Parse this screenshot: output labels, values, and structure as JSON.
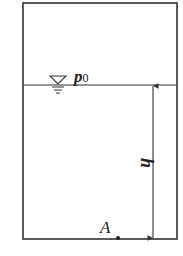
{
  "diagram": {
    "colors": {
      "stroke": "#333333",
      "text": "#222222",
      "background": "#ffffff"
    },
    "container": {
      "x": 23,
      "y": 3,
      "width": 154,
      "height": 236
    },
    "water_surface": {
      "y": 85,
      "pressure_label": "p",
      "pressure_subscript": "0",
      "free_surface_symbol": "inverted-triangle"
    },
    "dimension": {
      "label": "h",
      "x": 153,
      "y_top": 85,
      "y_bottom": 239
    },
    "point": {
      "label": "A",
      "x": 118,
      "y": 238
    }
  }
}
